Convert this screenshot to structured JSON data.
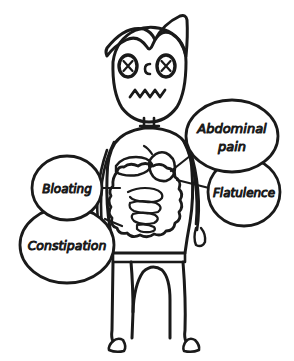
{
  "illustration": {
    "title": "IBS symptoms figure",
    "background_color": "#ffffff",
    "ink_color": "#1a1a1a"
  },
  "figure": {
    "name": "cartoon-person",
    "face": {
      "left_eye": "x-eye-icon",
      "right_eye": "x-eye-icon",
      "nose": "c-nose-icon",
      "mouth": "zigzag-mouth-icon"
    },
    "hair": "wavy-fringe-hair",
    "organs": {
      "stomach": "stomach-icon",
      "liver": "liver-icon",
      "intestines": "intestines-icon"
    }
  },
  "symptoms": [
    {
      "id": "abdominal-pain",
      "label": "Abdominal pain",
      "lines": [
        "Abdominal",
        "pain"
      ],
      "cx": 232,
      "cy": 136,
      "rx": 46,
      "ry": 36,
      "font_size": 13
    },
    {
      "id": "flatulence",
      "label": "Flatulence",
      "lines": [
        "Flatulence"
      ],
      "cx": 244,
      "cy": 192,
      "rx": 36,
      "ry": 34,
      "font_size": 12
    },
    {
      "id": "bloating",
      "label": "Bloating",
      "lines": [
        "Bloating"
      ],
      "cx": 67,
      "cy": 188,
      "rx": 35,
      "ry": 32,
      "font_size": 12
    },
    {
      "id": "constipation",
      "label": "Constipation",
      "lines": [
        "Constipation"
      ],
      "cx": 67,
      "cy": 245,
      "rx": 47,
      "ry": 38,
      "font_size": 12.5
    }
  ]
}
